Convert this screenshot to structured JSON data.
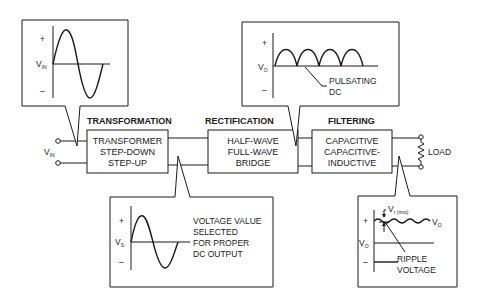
{
  "stages": [
    {
      "header": "TRANSFORMATION",
      "lines": [
        "TRANSFORMER",
        "STEP-DOWN",
        "STEP-UP"
      ]
    },
    {
      "header": "RECTIFICATION",
      "lines": [
        "HALF-WAVE",
        "FULL-WAVE",
        "BRIDGE"
      ]
    },
    {
      "header": "FILTERING",
      "lines": [
        "CAPACITIVE",
        "CAPACITIVE-",
        "INDUCTIVE"
      ]
    }
  ],
  "input": {
    "label": "V",
    "sub": "IN"
  },
  "load": {
    "label": "LOAD"
  },
  "callouts": {
    "input_wave": {
      "plus": "+",
      "minus": "–",
      "axis_label": "V",
      "axis_sub": "IN"
    },
    "pulsating": {
      "plus": "+",
      "minus": "–",
      "axis_label": "V",
      "axis_sub": "O",
      "note_lines": [
        "PULSATING",
        "DC"
      ]
    },
    "secondary": {
      "plus": "+",
      "minus": "–",
      "axis_label": "V",
      "axis_sub": "S",
      "note_lines": [
        "VOLTAGE VALUE",
        "SELECTED",
        "FOR PROPER",
        "DC OUTPUT"
      ]
    },
    "ripple": {
      "plus": "+",
      "minus": "–",
      "axis_label": "V",
      "axis_sub": "O",
      "wave_label": "V",
      "wave_sub": "O",
      "vr_label": "V",
      "vr_sub": "r (rms)",
      "note_lines": [
        "RIPPLE",
        "VOLTAGE"
      ]
    }
  }
}
